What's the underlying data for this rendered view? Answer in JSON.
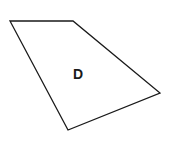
{
  "diagram": {
    "type": "quadrilateral",
    "label": "D",
    "vertices": [
      {
        "x": 10,
        "y": 21
      },
      {
        "x": 73,
        "y": 21
      },
      {
        "x": 160,
        "y": 93
      },
      {
        "x": 68,
        "y": 130
      }
    ],
    "label_position": {
      "x": 78,
      "y": 79
    },
    "stroke_color": "#1a1a1a",
    "fill_color": "#ffffff"
  }
}
